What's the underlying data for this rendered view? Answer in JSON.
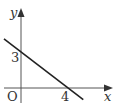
{
  "diagram": {
    "type": "linear-function-graph",
    "axes": {
      "x_label": "x",
      "y_label": "y",
      "origin_label": "O"
    },
    "line": {
      "y_intercept": 3,
      "x_intercept": 4,
      "slope": -0.75,
      "equation": "y = -3/4 x + 3"
    },
    "labels": {
      "y_intercept_label": "3",
      "x_intercept_label": "4"
    },
    "colors": {
      "line": "#222222",
      "axis": "#555555",
      "text": "#333333"
    }
  }
}
